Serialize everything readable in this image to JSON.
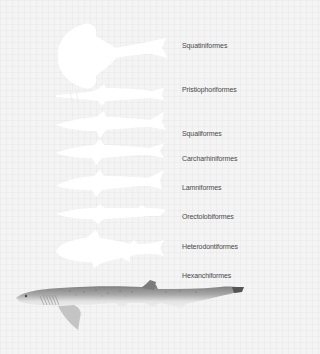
{
  "diagram": {
    "background_color": "#f4f4f4",
    "silhouette_color": "#ffffff",
    "label_color": "#4a4a4a",
    "orders": [
      {
        "label": "Squatiniformes",
        "y": 42
      },
      {
        "label": "Pristiophoriformes",
        "y": 85
      },
      {
        "label": "Squaliformes",
        "y": 130
      },
      {
        "label": "Carcharhiniformes",
        "y": 155
      },
      {
        "label": "Lamniformes",
        "y": 185
      },
      {
        "label": "Orectolobiformes",
        "y": 213
      },
      {
        "label": "Heterodontiformes",
        "y": 242
      },
      {
        "label": "Hexanchiformes",
        "y": 272
      }
    ],
    "illustration": {
      "name": "Hexanchiformes detailed drawing (sixgill shark)"
    }
  }
}
